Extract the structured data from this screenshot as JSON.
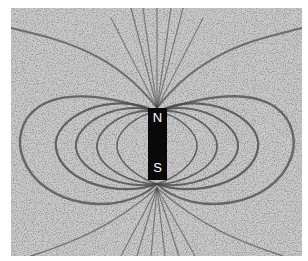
{
  "image": {
    "subject": "Iron filings showing magnetic field lines around a bar magnet",
    "magnet": {
      "north_label": "N",
      "south_label": "S"
    },
    "colors": {
      "background": "#c9c9c9",
      "filings": "#3a3a3a",
      "magnet": "#0a0a0a",
      "label": "#ffffff"
    }
  }
}
